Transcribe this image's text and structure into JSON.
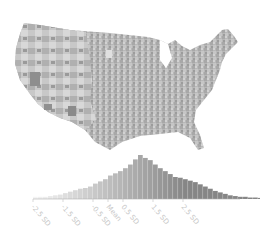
{
  "chart_data": {
    "type": "choropleth_map_with_histogram_legend",
    "title": "",
    "map": {
      "region": "Contiguous United States",
      "unit": "county",
      "color_scale": [
        "#f4f4f4",
        "#d8d8d8",
        "#bcbcbc",
        "#a0a0a0",
        "#848484"
      ]
    },
    "histogram": {
      "type": "bar",
      "xlabel": "",
      "ylabel": "",
      "tick_labels": [
        "-2.5 SD",
        "-1.5 SD",
        "-0.5 SD",
        "Mean",
        "0.5 SD",
        "1.5 SD",
        "2.5 SD"
      ],
      "tick_positions_sd": [
        -2.5,
        -1.5,
        -0.5,
        0,
        0.5,
        1.5,
        2.5
      ],
      "bin_width_sd": 0.1667,
      "bins_start_sd": -2.5,
      "values": [
        3,
        3,
        3,
        4,
        5,
        6,
        8,
        10,
        12,
        14,
        15,
        17,
        21,
        24,
        27,
        32,
        35,
        38,
        42,
        47,
        54,
        60,
        56,
        53,
        47,
        42,
        38,
        34,
        30,
        29,
        27,
        25,
        23,
        20,
        17,
        14,
        11,
        9,
        7,
        5,
        4,
        3,
        3,
        2,
        2,
        1.5,
        1.5,
        1,
        1,
        1,
        1,
        1,
        1,
        1,
        1,
        1,
        1,
        1,
        1,
        1,
        1,
        1
      ],
      "grid": false,
      "legend": "none"
    }
  }
}
